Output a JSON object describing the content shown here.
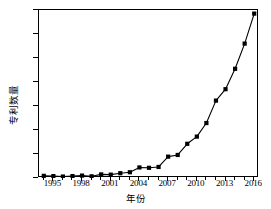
{
  "chart_data": {
    "type": "line",
    "title": "",
    "xlabel": "年份",
    "ylabel": "专利数量",
    "xlim": [
      1993.5,
      2016.5
    ],
    "ylim": [
      0,
      1400
    ],
    "grid": false,
    "legend": null,
    "marker": "square",
    "line_color": "#000000",
    "marker_color": "#000000",
    "x_ticks": [
      1995,
      1998,
      2001,
      2004,
      2007,
      2010,
      2013,
      2016
    ],
    "x_tick_labels": [
      "1995",
      "1998",
      "2001",
      "2004",
      "2007",
      "2010",
      "2013",
      "2016"
    ],
    "y_ticks": [
      0,
      200,
      400,
      600,
      800,
      1000,
      1200,
      1400
    ],
    "y_tick_labels": [
      "0",
      "200",
      "400",
      "600",
      "800",
      "1000",
      "1200",
      "1400"
    ],
    "x": [
      1994,
      1995,
      1996,
      1997,
      1998,
      1999,
      2000,
      2001,
      2002,
      2003,
      2004,
      2005,
      2006,
      2007,
      2008,
      2009,
      2010,
      2011,
      2012,
      2013,
      2014,
      2015,
      2016
    ],
    "values": [
      18,
      16,
      12,
      16,
      20,
      14,
      30,
      28,
      40,
      48,
      88,
      85,
      92,
      178,
      192,
      285,
      345,
      458,
      645,
      740,
      910,
      1120,
      1370
    ],
    "series": [
      {
        "name": "专利数量",
        "values": [
          18,
          16,
          12,
          16,
          20,
          14,
          30,
          28,
          40,
          48,
          88,
          85,
          92,
          178,
          192,
          285,
          345,
          458,
          645,
          740,
          910,
          1120,
          1370
        ]
      }
    ]
  }
}
